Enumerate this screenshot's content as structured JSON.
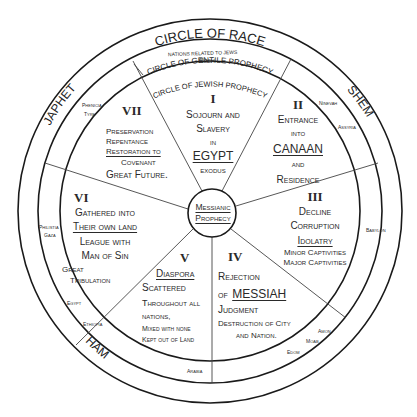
{
  "diagram": {
    "outer_ring": {
      "title": "CIRCLE OF RACE",
      "races": [
        "JAPHET",
        "SHEM",
        "HAM"
      ]
    },
    "middle_ring": {
      "title": "CIRCLE OF GENTILE PROPHECY",
      "subtitle": "NATIONS RELATED TO JEWS",
      "nations": {
        "rosh": "Rosh",
        "phenicia": "Phenicia",
        "tyre": "Tyre",
        "ninevah": "Ninevah",
        "assyria": "Assyria",
        "babylon": "Babylon",
        "philistia": "Philistia",
        "gaza": "Gaza",
        "egypt": "Egypt",
        "ethiopia": "Ethiopia",
        "arabia": "Arabia",
        "amon": "Amon",
        "moab": "Moab",
        "edom": "Edom"
      }
    },
    "inner_ring": {
      "title": "CIRCLE OF JEWISH PROPHECY"
    },
    "center": {
      "line1": "Messianic",
      "line2": "Prophecy"
    },
    "sectors": [
      {
        "numeral": "I",
        "lines": [
          "Sojourn and",
          "Slavery",
          "in",
          "EGYPT",
          "exodus"
        ]
      },
      {
        "numeral": "II",
        "lines": [
          "Entrance",
          "into",
          "CANAAN",
          "and",
          "Residence"
        ]
      },
      {
        "numeral": "III",
        "lines": [
          "Decline",
          "Corruption",
          "Idolatry",
          "Minor Captivities",
          "Major Captivities"
        ]
      },
      {
        "numeral": "IV",
        "lines": [
          "Rejection",
          "of",
          "MESSIAH",
          "Judgment",
          "Destruction of City",
          "and Nation."
        ]
      },
      {
        "numeral": "V",
        "lines": [
          "Diaspora",
          "Scattered",
          "Throughout all",
          "nations,",
          "Mixed with none",
          "Kept out of Land"
        ]
      },
      {
        "numeral": "VI",
        "lines": [
          "Gathered into",
          "Their own land",
          "League with",
          "Man of Sin",
          "Great",
          "Tribulation"
        ]
      },
      {
        "numeral": "VII",
        "lines": [
          "Preservation",
          "Repentance",
          "Restoration to",
          "Covenant",
          "Great Future."
        ]
      }
    ]
  }
}
